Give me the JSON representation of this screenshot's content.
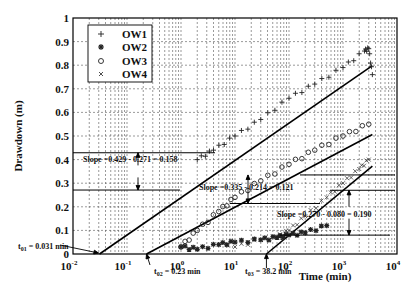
{
  "chart_data": {
    "type": "scatter",
    "title": "",
    "xlabel": "Time (min)",
    "ylabel": "Drawdown (m)",
    "xscale": "log",
    "xlim": [
      0.01,
      10000
    ],
    "ylim": [
      0,
      1
    ],
    "grid": true,
    "legend_position": "upper left",
    "x_ticks": [
      "10^-2",
      "10^-1",
      "10^0",
      "10^1",
      "10^2",
      "10^3",
      "10^4"
    ],
    "y_ticks": [
      "0",
      "0.1",
      "0.2",
      "0.3",
      "0.4",
      "0.5",
      "0.6",
      "0.7",
      "0.8",
      "0.9",
      "1"
    ],
    "series": [
      {
        "name": "OW1",
        "marker": "+",
        "points": [
          [
            2,
            0.4
          ],
          [
            4,
            0.44
          ],
          [
            10,
            0.5
          ],
          [
            30,
            0.57
          ],
          [
            100,
            0.66
          ],
          [
            300,
            0.72
          ],
          [
            1000,
            0.79
          ],
          [
            2500,
            0.86
          ],
          [
            3000,
            0.87
          ],
          [
            3500,
            0.76
          ]
        ],
        "fit": {
          "t0": 0.031,
          "slope": 0.158,
          "label_t0": "t01 = 0.031 min",
          "label_slope": "Slope =0.429 - 0.271 = 0.158"
        }
      },
      {
        "name": "OW2",
        "marker": "*",
        "points": [
          [
            1,
            0.03
          ],
          [
            2,
            0.02
          ],
          [
            5,
            0.04
          ],
          [
            10,
            0.05
          ],
          [
            30,
            0.06
          ],
          [
            60,
            0.07
          ],
          [
            100,
            0.08
          ],
          [
            200,
            0.09
          ],
          [
            500,
            0.12
          ]
        ]
      },
      {
        "name": "OW3",
        "marker": "o",
        "points": [
          [
            1,
            0.03
          ],
          [
            2,
            0.1
          ],
          [
            5,
            0.18
          ],
          [
            10,
            0.24
          ],
          [
            30,
            0.31
          ],
          [
            100,
            0.38
          ],
          [
            300,
            0.44
          ],
          [
            1000,
            0.5
          ],
          [
            3000,
            0.55
          ]
        ],
        "fit": {
          "t0": 0.23,
          "slope": 0.121,
          "label_t0": "t02 = 0.23 min",
          "label_slope": "Slope =0.335 - 0.214 = 0.121"
        }
      },
      {
        "name": "OW4",
        "marker": "x",
        "points": [
          [
            10,
            0.03
          ],
          [
            30,
            0.06
          ],
          [
            60,
            0.07
          ],
          [
            100,
            0.1
          ],
          [
            200,
            0.16
          ],
          [
            500,
            0.24
          ],
          [
            1000,
            0.3
          ],
          [
            2000,
            0.36
          ],
          [
            3000,
            0.4
          ]
        ],
        "fit": {
          "t0": 38.2,
          "slope": 0.19,
          "label_t0": "t03 = 38.2 min",
          "label_slope": "Slope =0.270 - 0.080 = 0.190"
        }
      }
    ],
    "annotations": [
      "t01 = 0.031 min",
      "t02 = 0.23 min",
      "t03 = 38.2 min",
      "Slope =0.429 - 0.271 = 0.158",
      "Slope =0.335 - 0.214 = 0.121",
      "Slope =0.270 - 0.080 = 0.190"
    ]
  },
  "labels": {
    "xlabel": "Time (min)",
    "ylabel": "Drawdown (m)",
    "y_ticks": [
      "0",
      "0.1",
      "0.2",
      "0.3",
      "0.4",
      "0.5",
      "0.6",
      "0.7",
      "0.8",
      "0.9",
      "1"
    ],
    "x_base": "10",
    "x_exps": [
      "-2",
      "-1",
      "0",
      "1",
      "2",
      "3",
      "4"
    ],
    "legend": [
      "OW1",
      "OW2",
      "OW3",
      "OW4"
    ],
    "slope1": "Slope =0.429 - 0.271 = 0.158",
    "slope2": "Slope =0.335 - 0.214 = 0.121",
    "slope3": "Slope =0.270 - 0.080 = 0.190",
    "t01_main": "t",
    "t01_sub": "01",
    "t01_val": " = 0.031 min",
    "t02_main": "t",
    "t02_sub": "02",
    "t02_val": " = 0.23 min",
    "t03_main": "t",
    "t03_sub": "03",
    "t03_val": " = 38.2 min"
  }
}
